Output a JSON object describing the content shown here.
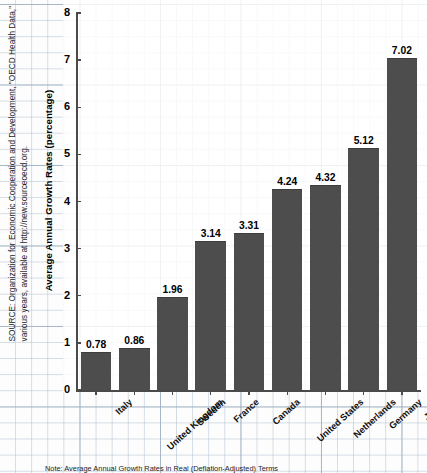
{
  "chart_data": {
    "type": "bar",
    "title": "",
    "xlabel": "",
    "ylabel": "Average Annual Growth Rates (percentage)",
    "ylim": [
      0,
      8
    ],
    "ytick_labels": [
      "0",
      "1",
      "2",
      "3",
      "4",
      "5",
      "6",
      "7",
      "8"
    ],
    "ytick_values": [
      0,
      1,
      2,
      3,
      4,
      5,
      6,
      7,
      8
    ],
    "grid": true,
    "legend": "none",
    "categories": [
      "Italy",
      "United Kingdom",
      "Sweden",
      "France",
      "Canada",
      "United States",
      "Netherlands",
      "Germany",
      "Japan"
    ],
    "values": [
      0.78,
      0.86,
      1.96,
      3.14,
      3.31,
      4.24,
      4.32,
      5.12,
      7.02
    ],
    "data_labels": [
      "0.78",
      "0.86",
      "1.96",
      "3.14",
      "3.31",
      "4.24",
      "4.32",
      "5.12",
      "7.02"
    ],
    "bar_color": "#4d4d4d",
    "axis_color": "#4a4a4a",
    "background_color": "#ffffff",
    "grid_color": "#b0c0d0"
  },
  "annotations": {
    "source": "SOURCE: Organization for Economic Cooperation and Development, \"OECD Health Data,\" various years, available at http://new.sourceoecd.org.",
    "note": "Note: Average Annual Growth Rates in Real (Deflation-Adjusted) Terms"
  }
}
